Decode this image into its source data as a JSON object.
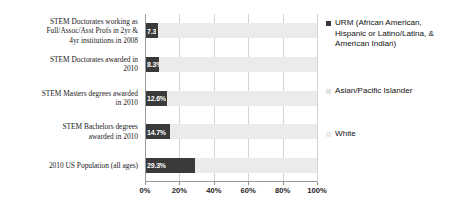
{
  "chart_data": {
    "type": "bar",
    "subtype": "horizontal-stacked-100-percent",
    "title": "",
    "xlabel": "",
    "ylabel": "",
    "xlim": [
      0,
      100
    ],
    "grid": true,
    "legend_position": "right",
    "xticks": [
      "0%",
      "20%",
      "40%",
      "60%",
      "80%",
      "100%"
    ],
    "xtick_values": [
      0,
      20,
      40,
      60,
      80,
      100
    ],
    "categories": [
      "STEM Doctorates working as\nFull/Assoc/Asst Profs in 2yr &\n4yr institutions in 2008",
      "STEM Doctorates awarded in\n2010",
      "STEM Masters degrees awarded\nin 2010",
      "STEM Bachelors degrees\nawarded in 2010",
      "2010 US Population (all ages)"
    ],
    "series": [
      {
        "name": "URM (African American, Hispanic or Latino/Latina, & American Indian)",
        "color": "#3a3a3a",
        "values": [
          7.3,
          8.3,
          12.6,
          14.7,
          29.3
        ],
        "labels": [
          "7.3",
          "8.3%",
          "12.6%",
          "14.7%",
          "29.3%"
        ]
      },
      {
        "name": "Asian/Pacific Islander",
        "color": "#e3e3e3",
        "values": [
          0,
          0,
          0,
          0,
          0
        ],
        "labels": [
          "",
          "",
          "",
          "",
          ""
        ]
      },
      {
        "name": "White",
        "color": "#ebebeb",
        "values": [
          92.7,
          91.7,
          87.4,
          85.3,
          70.7
        ],
        "labels": [
          "",
          "",
          "",
          "",
          ""
        ]
      }
    ],
    "legend_entries": [
      {
        "label": "URM (African American, Hispanic or Latino/Latina, & American Indian)",
        "color": "#3a3a3a"
      },
      {
        "label": "Asian/Pacific Islander",
        "color": "#e3e3e3"
      },
      {
        "label": "White",
        "color": "#ebebeb"
      }
    ]
  },
  "colors": {
    "urm": "#3a3a3a",
    "asian_pacific_islander": "#e3e3e3",
    "white": "#ebebeb",
    "gridline": "#d4d4d4",
    "axis": "#9a9a9a",
    "text": "#1a1a1a",
    "datalabel_text": "#ffffff",
    "background": "#ffffff"
  }
}
